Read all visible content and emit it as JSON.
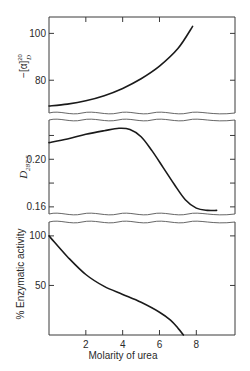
{
  "chart_data": [
    {
      "type": "line",
      "panel": "top",
      "ylabel": "−[α]",
      "ylabel_superscript": "20",
      "ylabel_subscript": "D",
      "xlim": [
        0,
        10.1
      ],
      "ylim": [
        66,
        107
      ],
      "y_ticks": [
        80,
        100
      ],
      "y_tick_labels": [
        "80",
        "100"
      ],
      "broken_axis_bottom": true,
      "series": [
        {
          "name": "optical rotation",
          "x": [
            0,
            1,
            2,
            3,
            4,
            5,
            6,
            7,
            7.8
          ],
          "y": [
            69,
            69.8,
            71.2,
            73.4,
            76.5,
            80.6,
            86,
            93.5,
            103
          ]
        }
      ]
    },
    {
      "type": "line",
      "panel": "middle",
      "ylabel": "D",
      "ylabel_subscript": "287.5",
      "xlim": [
        0,
        10.1
      ],
      "ylim": [
        0.154,
        0.233
      ],
      "y_ticks": [
        0.16,
        0.18,
        0.2,
        0.22
      ],
      "y_tick_labels": [
        "0.16",
        "",
        "0.20",
        ""
      ],
      "broken_axis_top": true,
      "broken_axis_bottom": true,
      "series": [
        {
          "name": "optical density 287.5",
          "x": [
            0,
            1,
            2,
            3,
            3.8,
            4.4,
            5,
            5.6,
            6.2,
            6.8,
            7.4,
            8.0,
            8.6,
            9.1
          ],
          "y": [
            0.214,
            0.217,
            0.221,
            0.224,
            0.226,
            0.225,
            0.219,
            0.207,
            0.193,
            0.179,
            0.166,
            0.159,
            0.157,
            0.157
          ]
        }
      ]
    },
    {
      "type": "line",
      "panel": "bottom",
      "ylabel": "% Enzymatic activity",
      "xlabel": "Molarity of urea",
      "xlim": [
        0,
        10.1
      ],
      "ylim": [
        0,
        114
      ],
      "x_ticks": [
        2,
        4,
        6,
        8
      ],
      "x_tick_labels": [
        "2",
        "4",
        "6",
        "8"
      ],
      "y_ticks": [
        50,
        100
      ],
      "y_tick_labels": [
        "50",
        "100"
      ],
      "broken_axis_top": true,
      "series": [
        {
          "name": "enzymatic activity",
          "x": [
            0,
            1,
            2,
            3,
            4,
            5,
            6,
            6.6,
            7.0,
            7.3
          ],
          "y": [
            100,
            79,
            61,
            49,
            41,
            33,
            23,
            15,
            7,
            0
          ]
        }
      ]
    }
  ]
}
